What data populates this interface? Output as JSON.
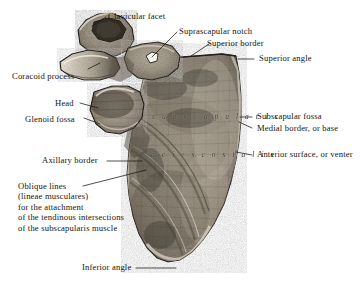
{
  "figure": {
    "background_color": "#ffffff",
    "ink_color": "#17140f",
    "bone_light": "#cfc6b6",
    "bone_mid": "#9a9184",
    "bone_dark": "#4a443b"
  },
  "engraved_text": {
    "subscapularis": "s u b s c a p u l a r i s",
    "facies_costalis": "f a c i e s   c o s t a l i s"
  },
  "labels": {
    "clavicular_facet": "Clavicular facet",
    "suprascapular_notch": "Suprascapular notch",
    "superior_border": "Superior border",
    "superior_angle": "Superior angle",
    "coracoid_process": "Coracoid process",
    "head": "Head",
    "glenoid_fossa": "Glenoid fossa",
    "subscapular_fossa": "Subscapular fossa",
    "medial_border": "Medial border, or base",
    "anterior_surface": "Anterior surface, or venter",
    "axillary_border": "Axillary border",
    "inferior_angle": "Inferior angle",
    "oblique_lines": {
      "line1": "Oblique lines",
      "line2": "(lineae musculares)",
      "line3": "for the attachment",
      "line4": "of the tendinous intersections",
      "line5": "of the subscapularis muscle"
    }
  }
}
